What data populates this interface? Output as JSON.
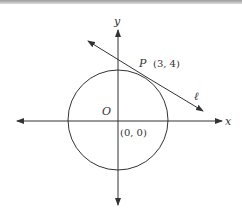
{
  "diagram": {
    "type": "coordinate-geometry",
    "axes": {
      "x_label": "x",
      "y_label": "y"
    },
    "center": {
      "label": "O",
      "coords": "(0, 0)"
    },
    "point": {
      "label": "P",
      "coords": "(3, 4)"
    },
    "line": {
      "label": "ℓ"
    },
    "colors": {
      "stroke": "#333333",
      "background": "#ffffff"
    }
  }
}
